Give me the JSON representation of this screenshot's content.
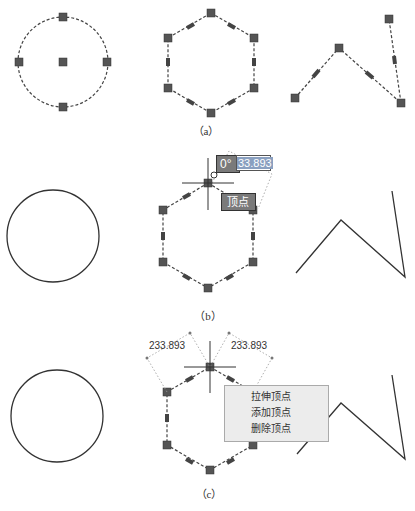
{
  "captions": {
    "a": "（a）",
    "b": "（b）",
    "c": "（c）"
  },
  "panel_b": {
    "angle_tooltip": "0°",
    "length_input_value": "33.893",
    "hover_tooltip": "顶点"
  },
  "panel_c": {
    "dimension_left": "233.893",
    "dimension_right": "233.893",
    "context_menu": {
      "items": [
        {
          "label": "拉伸顶点"
        },
        {
          "label": "添加顶点"
        },
        {
          "label": "删除顶点"
        }
      ]
    }
  }
}
